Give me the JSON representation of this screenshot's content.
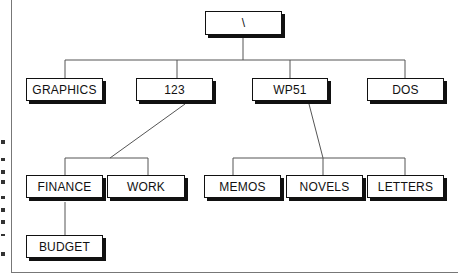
{
  "diagram": {
    "type": "directory-tree",
    "root": {
      "label": "\\"
    },
    "level1": [
      {
        "label": "GRAPHICS"
      },
      {
        "label": "123"
      },
      {
        "label": "WP51"
      },
      {
        "label": "DOS"
      }
    ],
    "children_of_123": [
      {
        "label": "FINANCE"
      },
      {
        "label": "WORK"
      }
    ],
    "children_of_wp51": [
      {
        "label": "MEMOS"
      },
      {
        "label": "NOVELS"
      },
      {
        "label": "LETTERS"
      }
    ],
    "children_of_finance": [
      {
        "label": "BUDGET"
      }
    ],
    "colors": {
      "line": "#555555",
      "box_border": "#111111",
      "shadow": "#111111"
    }
  }
}
